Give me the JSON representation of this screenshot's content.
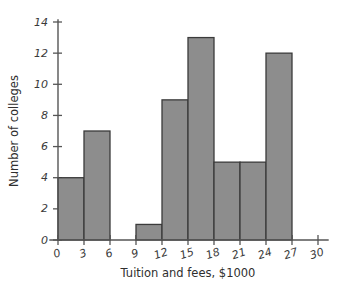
{
  "chart_data": {
    "type": "bar",
    "title": "",
    "subtitle": "",
    "xlabel": "Tuition and fees, $1000",
    "ylabel": "Number of colleges",
    "bin_width": 3,
    "categories": [
      "0-3",
      "3-6",
      "6-9",
      "9-12",
      "12-15",
      "15-18",
      "18-21",
      "21-24",
      "24-27",
      "27-30"
    ],
    "bin_starts": [
      0,
      3,
      6,
      9,
      12,
      15,
      18,
      21,
      24,
      27
    ],
    "values": [
      4,
      7,
      0,
      1,
      9,
      13,
      5,
      5,
      12,
      0
    ],
    "xlim": [
      0,
      30
    ],
    "ylim": [
      0,
      14
    ],
    "xticks": [
      0,
      3,
      6,
      9,
      12,
      15,
      18,
      21,
      24,
      27,
      30
    ],
    "yticks": [
      0,
      2,
      4,
      6,
      8,
      10,
      12,
      14
    ],
    "xtick_labels": [
      "0",
      "3",
      "6",
      "9",
      "12",
      "15",
      "18",
      "21",
      "24",
      "27",
      "30"
    ],
    "ytick_labels": [
      "0",
      "2",
      "4",
      "6",
      "8",
      "10",
      "12",
      "14"
    ],
    "grid": false,
    "legend": null,
    "legend_position": "none",
    "annotations": [],
    "colors": {
      "bar_fill": "#8d8d8d",
      "bar_edge": "#3b3b3b",
      "axis": "#555555",
      "text": "#2f2f2f",
      "background": "#ffffff"
    }
  }
}
